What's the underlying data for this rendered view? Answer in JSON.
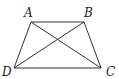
{
  "figure": {
    "type": "trapezoid with diagonals",
    "vertices": {
      "A": {
        "label": "A",
        "x": 31,
        "y": 22
      },
      "B": {
        "label": "B",
        "x": 84,
        "y": 22
      },
      "C": {
        "label": "C",
        "x": 101,
        "y": 68
      },
      "D": {
        "label": "D",
        "x": 14,
        "y": 68
      }
    },
    "segments": [
      "AB",
      "BC",
      "CD",
      "DA",
      "AC",
      "BD"
    ],
    "stroke_color": "#333333"
  }
}
